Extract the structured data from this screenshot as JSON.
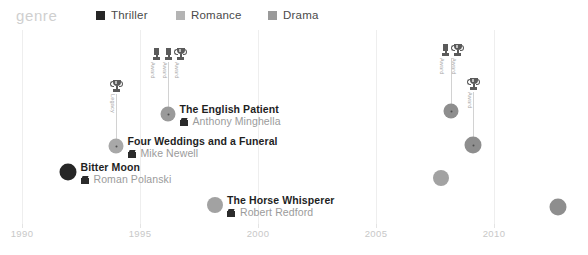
{
  "legend": {
    "title": "genre",
    "items": [
      {
        "label": "Thriller",
        "color": "#262626"
      },
      {
        "label": "Romance",
        "color": "#b4b4b4"
      },
      {
        "label": "Drama",
        "color": "#9a9a9a"
      }
    ]
  },
  "axis": {
    "ticks": [
      "1990",
      "1995",
      "2000",
      "2005",
      "2010"
    ],
    "x": [
      22,
      140,
      258,
      376,
      494
    ]
  },
  "chart_data": {
    "type": "scatter",
    "title": "genre",
    "xlabel": "",
    "ylabel": "",
    "xlim": [
      1990,
      2013
    ],
    "grid": true,
    "legend_position": "top",
    "categories": [
      "Thriller",
      "Romance",
      "Drama"
    ],
    "points": [
      {
        "title": "Bitter Moon",
        "director": "Roman Polanski",
        "year": 1992,
        "genre": "Thriller",
        "x": 68,
        "y": 172,
        "r": 8.5,
        "color": "#262626",
        "align": "right",
        "stem": 0,
        "awards": []
      },
      {
        "title": "Four Weddings and a Funeral",
        "director": "Mike Newell",
        "year": 1994,
        "genre": "Romance",
        "x": 116,
        "y": 146,
        "r": 7.5,
        "color": "#a8a8a8",
        "align": "right",
        "stem": 94,
        "awards": [
          {
            "label": "Legacy",
            "style": "cup"
          }
        ]
      },
      {
        "title": "The English Patient",
        "director": "Anthony Minghella",
        "year": 1996,
        "genre": "Drama",
        "x": 168,
        "y": 114,
        "r": 7.5,
        "color": "#9a9a9a",
        "align": "right",
        "stem": 62,
        "awards": [
          {
            "label": "Award",
            "style": "bar"
          },
          {
            "label": "Award",
            "style": "bar"
          },
          {
            "label": "Award",
            "style": "cup"
          }
        ]
      },
      {
        "title": "The Horse Whisperer",
        "director": "Robert Redford",
        "year": 1998,
        "genre": "Drama",
        "x": 215,
        "y": 205,
        "r": 8.0,
        "color": "#a2a2a2",
        "align": "right",
        "stem": 0,
        "awards": []
      },
      {
        "title": "I've Loved You So Long",
        "director": "Philippe Claudel",
        "year": 2008,
        "genre": "Drama",
        "x": 451,
        "y": 111,
        "r": 7.5,
        "color": "#8e8e8e",
        "align": "left",
        "stem": 58,
        "awards": [
          {
            "label": "Award",
            "style": "bar"
          },
          {
            "label": "Award",
            "style": "cup"
          }
        ]
      },
      {
        "title": "Nowhere Boy",
        "director": "Sam Taylor-Johnson",
        "year": 2009,
        "genre": "Drama",
        "x": 473,
        "y": 145,
        "r": 8.5,
        "color": "#8e8e8e",
        "align": "left",
        "stem": 92,
        "awards": [
          {
            "label": "Award",
            "style": "cup"
          }
        ]
      },
      {
        "title": "Leaving",
        "director": "Catherine Corsini",
        "year": 2009,
        "genre": "Drama",
        "x": 441,
        "y": 178,
        "r": 8.0,
        "color": "#a2a2a2",
        "align": "left",
        "stem": 0,
        "awards": []
      },
      {
        "title": "Only God Forgives",
        "director": "Nicolas Winding Refn",
        "year": 2013,
        "genre": "Drama",
        "x": 558,
        "y": 207,
        "r": 8.5,
        "color": "#8e8e8e",
        "align": "left",
        "stem": 0,
        "awards": []
      }
    ]
  }
}
